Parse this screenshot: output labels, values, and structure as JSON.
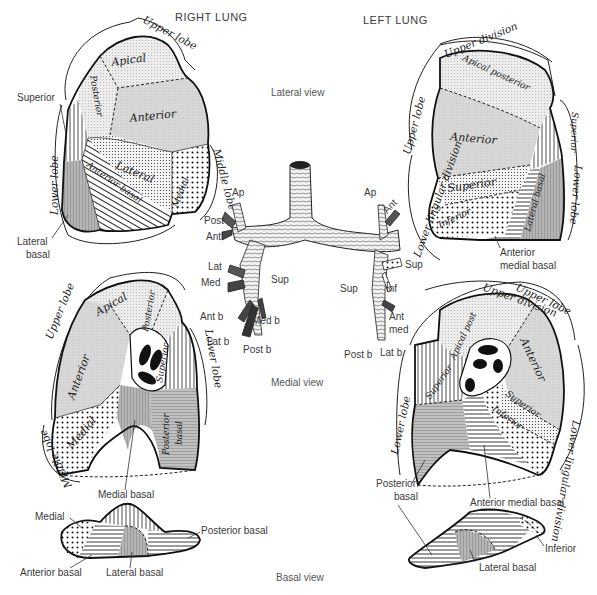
{
  "headers": {
    "right_lung": "RIGHT LUNG",
    "left_lung": "LEFT LUNG"
  },
  "views": {
    "lateral": "Lateral view",
    "medial": "Medial view",
    "basal": "Basal view"
  },
  "colors": {
    "line": "#111111",
    "light_stipple": "#e6e6e6",
    "mid_gray": "#c8c8c8",
    "dark_gray": "#a8a8a8",
    "background": "#ffffff"
  },
  "right_lateral": {
    "lobes": {
      "upper": "Upper lobe",
      "middle": "Middle lobe",
      "lower": "Lower lobe"
    },
    "segments": {
      "apical": "Apical",
      "posterior": "Posterior",
      "anterior": "Anterior",
      "lateral": "Lateral",
      "medial": "Medial",
      "anterior_basal": "Anterior basal"
    },
    "callouts": {
      "superior": "Superior",
      "lateral_basal_1": "Lateral",
      "lateral_basal_2": "basal"
    }
  },
  "left_lateral": {
    "lobes": {
      "upper": "Upper lobe",
      "upper_division": "Upper division",
      "lower": "Lower lobe",
      "lingular": "Lower lingular division"
    },
    "segments": {
      "apical_posterior": "Apical posterior",
      "anterior": "Anterior",
      "superior": "Superior",
      "inferior": "Inferior",
      "lateral_basal": "Lateral basal",
      "superior_lower": "Superior"
    },
    "callouts": {
      "anterior_medial_basal_1": "Anterior",
      "anterior_medial_basal_2": "medial basal"
    }
  },
  "bronchi": {
    "right": [
      "Ap",
      "Post",
      "Ant",
      "Lat",
      "Med",
      "Sup",
      "Ant b",
      "Med b",
      "Lat b",
      "Post b"
    ],
    "left": [
      "Ap",
      "Ant",
      "Sup",
      "Sup",
      "Inf",
      "Ant",
      "med",
      "Post b",
      "Lat b"
    ]
  },
  "right_medial": {
    "lobes": {
      "upper": "Upper lobe",
      "middle": "Middle lobe",
      "lower": "Lower lobe"
    },
    "segments": {
      "apical": "Apical",
      "posterior": "Posterior",
      "anterior": "Anterior",
      "superior": "Superior",
      "medial": "Medial",
      "posterior_basal_1": "Posterior",
      "posterior_basal_2": "basal"
    },
    "callouts": {
      "medial_basal": "Medial basal"
    }
  },
  "left_medial": {
    "lobes": {
      "upper": "Upper lobe",
      "upper_division": "Upper division",
      "lower": "Lower lobe",
      "lingular": "Lower lingular division"
    },
    "segments": {
      "apical_post": "Apical post",
      "anterior": "Anterior",
      "superior": "Superior",
      "superior_lingula": "Superior",
      "inferior": "Inferior"
    },
    "callouts": {
      "posterior_basal_1": "Posterior",
      "posterior_basal_2": "basal",
      "anterior_medial_basal": "Anterior medial basal"
    }
  },
  "right_basal": {
    "callouts": {
      "medial_basal": "Medial basal",
      "medial": "Medial",
      "posterior_basal": "Posterior basal",
      "anterior_basal": "Anterior basal",
      "lateral_basal": "Lateral basal"
    }
  },
  "left_basal": {
    "callouts": {
      "inferior": "Inferior",
      "lateral_basal": "Lateral basal"
    }
  }
}
